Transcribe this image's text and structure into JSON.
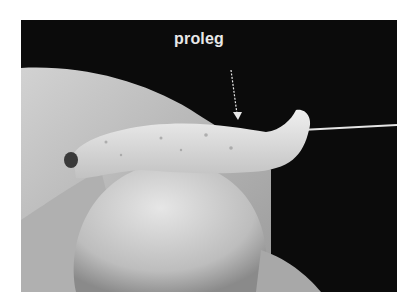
{
  "figure": {
    "annotation": {
      "label": "proleg",
      "arrow": "down"
    },
    "colors": {
      "background": "#0b0b0b",
      "label": "#e8e8e8",
      "skin": "#c9c9c9",
      "larva": "#dcdcdc"
    }
  }
}
